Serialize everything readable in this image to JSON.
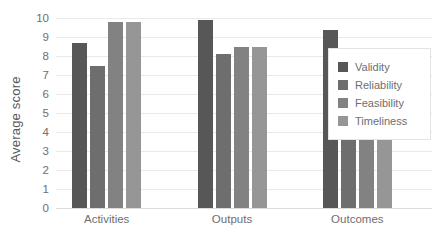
{
  "chart_data": {
    "type": "bar",
    "title": "",
    "subtitle": "",
    "xlabel": "",
    "ylabel": "Average score",
    "categories": [
      "Activities",
      "Outputs",
      "Outcomes"
    ],
    "series": [
      {
        "name": "Validity",
        "color": "#575757",
        "values": [
          8.7,
          9.9,
          9.35
        ]
      },
      {
        "name": "Reliability",
        "color": "#6e6e6e",
        "values": [
          7.5,
          8.1,
          7.0
        ]
      },
      {
        "name": "Feasibility",
        "color": "#828282",
        "values": [
          9.8,
          8.5,
          5.8
        ]
      },
      {
        "name": "Timeliness",
        "color": "#969696",
        "values": [
          9.8,
          8.5,
          5.6
        ]
      }
    ],
    "ylim": [
      0,
      10
    ],
    "ytick_labels": [
      "0",
      "1",
      "2",
      "3",
      "4",
      "5",
      "6",
      "7",
      "8",
      "9",
      "10"
    ],
    "yticks": [
      0,
      1,
      2,
      3,
      4,
      5,
      6,
      7,
      8,
      9,
      10
    ],
    "grid": true,
    "grid_color": "#e9e9e9",
    "legend_position": "right",
    "background": "#ffffff",
    "text_color": "#6d6e71"
  }
}
